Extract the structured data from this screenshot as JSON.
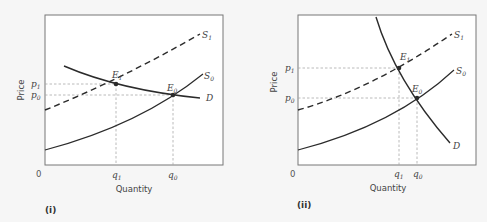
{
  "panels": [
    {
      "id": "i",
      "label": "(i)",
      "xlabel": "Quantity",
      "ylabel": "Price",
      "origin": "0",
      "curves": {
        "S1": {
          "label": "S",
          "sub": "1",
          "style": "dashed"
        },
        "S0": {
          "label": "S",
          "sub": "0",
          "style": "solid"
        },
        "D": {
          "label": "D",
          "style": "solid"
        }
      },
      "points": {
        "E1": {
          "label": "E",
          "sub": "1"
        },
        "E0": {
          "label": "E",
          "sub": "0"
        }
      },
      "yticks": [
        {
          "label": "p",
          "sub": "1"
        },
        {
          "label": "p",
          "sub": "0"
        }
      ],
      "xticks": [
        {
          "label": "q",
          "sub": "1"
        },
        {
          "label": "q",
          "sub": "0"
        }
      ]
    },
    {
      "id": "ii",
      "label": "(ii)",
      "xlabel": "Quantity",
      "ylabel": "Price",
      "origin": "0",
      "curves": {
        "S1": {
          "label": "S",
          "sub": "1",
          "style": "dashed"
        },
        "S0": {
          "label": "S",
          "sub": "0",
          "style": "solid"
        },
        "D": {
          "label": "D",
          "style": "solid"
        }
      },
      "points": {
        "E1": {
          "label": "E",
          "sub": "1"
        },
        "E0": {
          "label": "E",
          "sub": "0"
        }
      },
      "yticks": [
        {
          "label": "p",
          "sub": "1"
        },
        {
          "label": "p",
          "sub": "0"
        }
      ],
      "xticks": [
        {
          "label": "q",
          "sub": "1"
        },
        {
          "label": "q",
          "sub": "0"
        }
      ]
    }
  ],
  "colors": {
    "curve": "#2b2b2b",
    "axis": "#6a6a6a",
    "guide": "#a8a8a8",
    "background": "#f6f6f6",
    "plot_bg": "#ffffff"
  }
}
